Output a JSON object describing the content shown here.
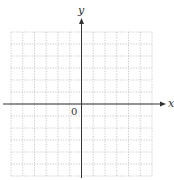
{
  "diagram": {
    "type": "coordinate-grid",
    "x_axis_label": "x",
    "y_axis_label": "y",
    "origin_label": "0",
    "grid": {
      "columns": 12,
      "rows": 12,
      "left": 11,
      "top": 32,
      "right": 152,
      "bottom": 176,
      "line_style": "dotted",
      "line_color": "#bdbdbd"
    },
    "axes": {
      "color": "#333333",
      "x_axis_y": 104,
      "x_axis_from": 3,
      "x_axis_to": 166,
      "y_axis_x": 81.5,
      "y_axis_from": 178,
      "y_axis_to": 18
    }
  }
}
